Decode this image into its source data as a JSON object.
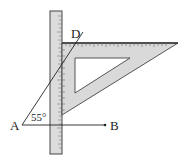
{
  "figure": {
    "labels": {
      "point_a": "A",
      "point_b": "B",
      "point_d": "D",
      "angle": "55°"
    },
    "colors": {
      "background": "#ffffff",
      "tool_fill": "#d9d9d9",
      "stroke": "#333333"
    },
    "objects": [
      "ruler",
      "set-square",
      "ray-AD",
      "ray-AB"
    ]
  }
}
